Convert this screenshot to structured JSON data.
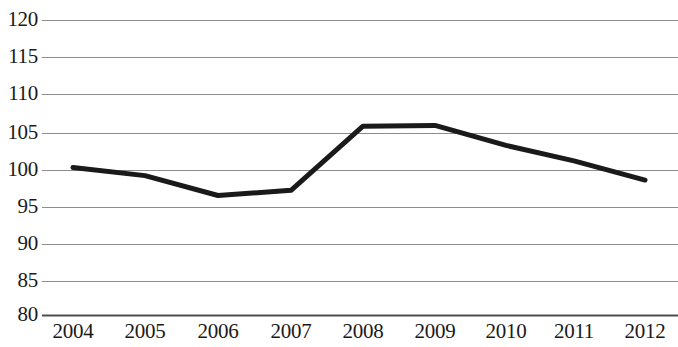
{
  "chart_data": {
    "type": "line",
    "title": "",
    "subtitle": "",
    "xlabel": "",
    "ylabel": "",
    "categories": [
      "2004",
      "2005",
      "2006",
      "2007",
      "2008",
      "2009",
      "2010",
      "2011",
      "2012"
    ],
    "values": [
      100.0,
      98.9,
      96.2,
      96.9,
      105.6,
      105.7,
      103.0,
      100.9,
      98.3
    ],
    "series": [
      {
        "name": "",
        "values": [
          100.0,
          98.9,
          96.2,
          96.9,
          105.6,
          105.7,
          103.0,
          100.9,
          98.3
        ],
        "color": "#1a1a1a",
        "line_width": 5,
        "markers": false
      }
    ],
    "ylim": [
      80,
      120
    ],
    "ytick_labels": [
      "120",
      "115",
      "110",
      "105",
      "100",
      "95",
      "90",
      "85",
      "80"
    ],
    "ytick_values": [
      120,
      115,
      110,
      105,
      100,
      95,
      90,
      85,
      80
    ],
    "xtick_labels": [
      "2004",
      "2005",
      "2006",
      "2007",
      "2008",
      "2009",
      "2010",
      "2011",
      "2012"
    ],
    "grid": true,
    "grid_axis": "y",
    "grid_color": "#8c8c8c",
    "axis_color": "#4d4d4d",
    "legend": false,
    "legend_position": "none",
    "annotations": [],
    "background_color": "#ffffff"
  },
  "geometry": {
    "plot_left": 42,
    "plot_right": 678,
    "plot_top": 20,
    "plot_bottom": 315,
    "point_x": [
      73,
      145,
      218,
      291,
      363,
      435,
      506,
      574,
      645
    ],
    "gridline_y": [
      20,
      57,
      94,
      133,
      170,
      207,
      244,
      281,
      315
    ],
    "xlabel_center_x": [
      73,
      145,
      218,
      291,
      363,
      435,
      506,
      574,
      645
    ]
  }
}
